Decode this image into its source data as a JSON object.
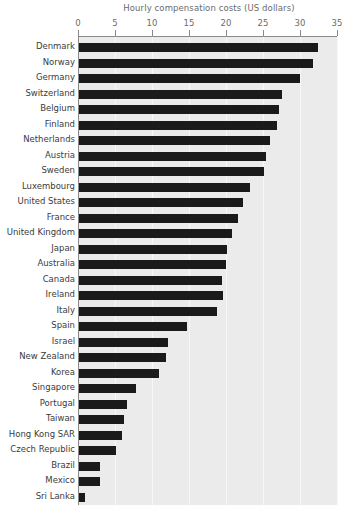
{
  "chart_data": {
    "type": "bar",
    "orientation": "horizontal",
    "title": "Hourly compensation costs (US dollars)",
    "xlabel": "",
    "ylabel": "",
    "xlim": [
      0,
      35
    ],
    "xticks": [
      0,
      5,
      10,
      15,
      20,
      25,
      30,
      35
    ],
    "xtick_labels": [
      "0",
      "5",
      "10",
      "15",
      "20",
      "25",
      "30",
      "35"
    ],
    "grid": true,
    "grid_axis": "x",
    "legend": false,
    "bar_color": "#1a1a1a",
    "plot_background": "#ebebeb",
    "categories": [
      "Denmark",
      "Norway",
      "Germany",
      "Switzerland",
      "Belgium",
      "Finland",
      "Netherlands",
      "Austria",
      "Sweden",
      "Luxembourg",
      "United States",
      "France",
      "United Kingdom",
      "Japan",
      "Australia",
      "Canada",
      "Ireland",
      "Italy",
      "Spain",
      "Israel",
      "New Zealand",
      "Korea",
      "Singapore",
      "Portugal",
      "Taiwan",
      "Hong Kong SAR",
      "Czech Republic",
      "Brazil",
      "Mexico",
      "Sri Lanka"
    ],
    "values": [
      32.4,
      31.8,
      30.0,
      27.6,
      27.1,
      26.9,
      26.0,
      25.4,
      25.2,
      23.2,
      22.3,
      21.6,
      20.8,
      20.1,
      20.0,
      19.4,
      19.6,
      18.8,
      14.7,
      12.2,
      11.9,
      11.0,
      7.9,
      6.6,
      6.2,
      5.9,
      5.1,
      3.0,
      3.0,
      0.9
    ]
  }
}
